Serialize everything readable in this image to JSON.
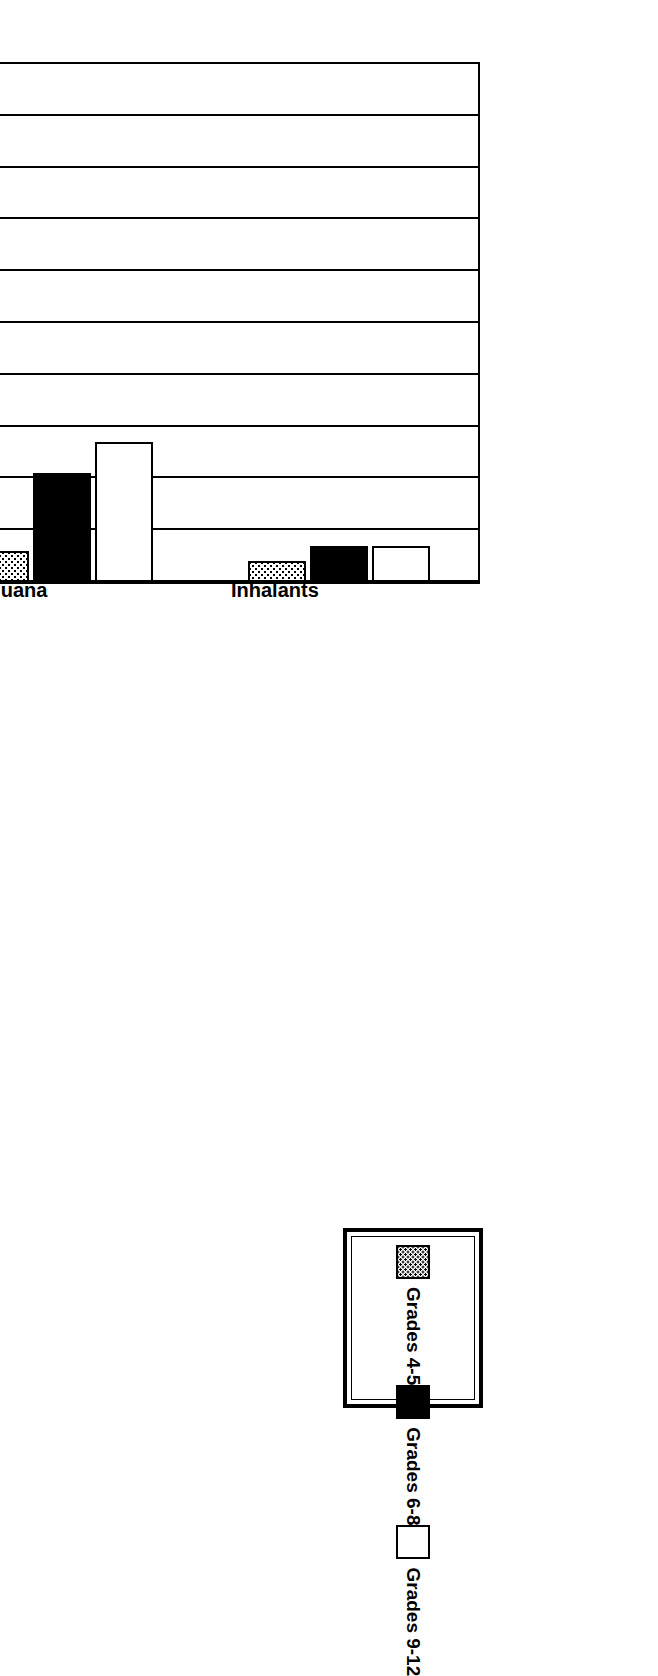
{
  "chart_data": {
    "type": "bar",
    "orientation": "horizontal",
    "title": "Use in Baseline Year",
    "xlabel": "",
    "ylabel": "Percentage",
    "value_axis_label": "Percentage",
    "categories": [
      "Alcohol",
      "Cigarettes",
      "Marijuana",
      "Inhalants"
    ],
    "series": [
      {
        "name": "Grades 4-5",
        "fill": "dotted",
        "values": [
          8,
          9,
          6,
          4
        ]
      },
      {
        "name": "Grades 6-8",
        "fill": "black",
        "values": [
          24,
          22,
          21,
          7
        ]
      },
      {
        "name": "Grades 9-12",
        "fill": "white",
        "values": [
          53,
          51,
          27,
          7
        ]
      }
    ],
    "ylim": [
      0,
      100
    ],
    "tick_labels": [
      "100",
      "90",
      "80",
      "70",
      "60",
      "50",
      "40",
      "30",
      "20",
      "10",
      "0"
    ],
    "tick_values": [
      100,
      90,
      80,
      70,
      60,
      50,
      40,
      30,
      20,
      10,
      0
    ],
    "grid": true,
    "legend_position": "top-right",
    "colors": {
      "ink": "#000000",
      "background": "#ffffff"
    }
  },
  "legend": {
    "entries": [
      {
        "label": "Grades 4-5",
        "swatch": "dotted-swatch"
      },
      {
        "label": "Grades 6-8",
        "swatch": "black-swatch"
      },
      {
        "label": "Grades 9-12",
        "swatch": "white-swatch"
      }
    ]
  }
}
